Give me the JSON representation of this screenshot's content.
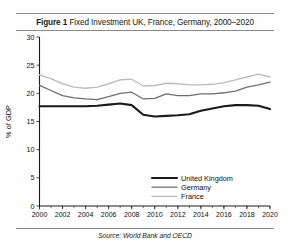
{
  "figure": {
    "label": "Figure 1",
    "title": "Fixed Investment UK, France, Germany, 2000–2020",
    "source": "Source: World Bank and OECD"
  },
  "chart_data": {
    "type": "line",
    "title": "Fixed Investment UK, France, Germany, 2000–2020",
    "xlabel": "",
    "ylabel": "% of GDP",
    "xlim": [
      2000,
      2020
    ],
    "ylim": [
      0,
      30
    ],
    "yticks": [
      0,
      5,
      10,
      15,
      20,
      25,
      30
    ],
    "ytick_labels": [
      "0",
      "5",
      "10",
      "15",
      "20",
      "25",
      "30"
    ],
    "xticks": [
      2000,
      2002,
      2004,
      2006,
      2008,
      2010,
      2012,
      2014,
      2016,
      2018,
      2020
    ],
    "xtick_labels": [
      "2000",
      "2002",
      "2004",
      "2006",
      "2008",
      "2010",
      "2012",
      "2014",
      "2016",
      "2018",
      "2020"
    ],
    "xtick_minor_step": 1,
    "grid": false,
    "legend_position": "lower right",
    "x": [
      2000,
      2001,
      2002,
      2003,
      2004,
      2005,
      2006,
      2007,
      2008,
      2009,
      2010,
      2011,
      2012,
      2013,
      2014,
      2015,
      2016,
      2017,
      2018,
      2019,
      2020
    ],
    "series": [
      {
        "name": "United Kingdom",
        "color": "#1a1a1a",
        "width": 2.1,
        "values": [
          17.7,
          17.7,
          17.7,
          17.7,
          17.7,
          17.8,
          18.0,
          18.2,
          17.9,
          16.2,
          15.9,
          16.0,
          16.1,
          16.3,
          16.9,
          17.3,
          17.7,
          17.9,
          17.9,
          17.8,
          17.2
        ]
      },
      {
        "name": "Germany",
        "color": "#6e6e6e",
        "width": 1.3,
        "values": [
          21.4,
          20.5,
          19.6,
          19.2,
          19.0,
          18.9,
          19.4,
          20.0,
          20.2,
          19.0,
          19.1,
          19.9,
          19.6,
          19.6,
          19.9,
          19.9,
          20.1,
          20.4,
          21.1,
          21.5,
          22.0
        ]
      },
      {
        "name": "France",
        "color": "#bdbdbd",
        "width": 1.4,
        "values": [
          23.3,
          22.6,
          21.7,
          21.1,
          20.9,
          21.1,
          21.7,
          22.4,
          22.5,
          21.3,
          21.4,
          21.8,
          21.7,
          21.5,
          21.5,
          21.6,
          21.9,
          22.4,
          22.9,
          23.4,
          22.9
        ]
      }
    ],
    "legend": [
      {
        "name": "United Kingdom",
        "color": "#1a1a1a",
        "width": 2.1
      },
      {
        "name": "Germany",
        "color": "#6e6e6e",
        "width": 1.3
      },
      {
        "name": "France",
        "color": "#bdbdbd",
        "width": 1.4
      }
    ]
  }
}
